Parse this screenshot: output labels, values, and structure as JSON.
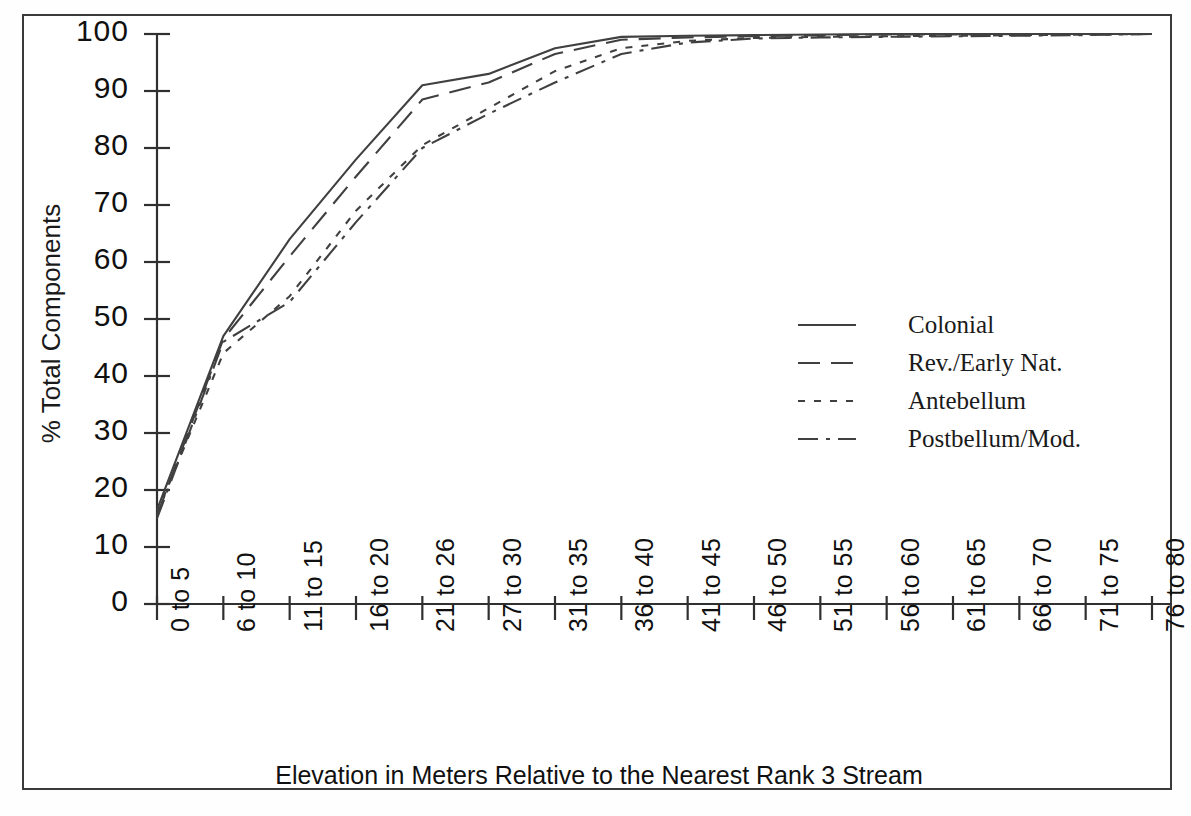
{
  "chart_data": {
    "type": "line",
    "title": "",
    "xlabel": "Elevation in Meters Relative to the Nearest Rank 3 Stream",
    "ylabel": "% Total Components",
    "categories": [
      "0 to 5",
      "6 to 10",
      "11 to 15",
      "16 to 20",
      "21 to 26",
      "27 to 30",
      "31 to 35",
      "36 to 40",
      "41 to 45",
      "46 to 50",
      "51 to 55",
      "56 to 60",
      "61 to 65",
      "66 to 70",
      "71 to 75",
      "76 to 80"
    ],
    "ylim": [
      0,
      100
    ],
    "yticks": [
      0,
      10,
      20,
      30,
      40,
      50,
      60,
      70,
      80,
      90,
      100
    ],
    "ytick_labels": [
      "0",
      "10",
      "20",
      "30",
      "40",
      "50",
      "60",
      "70",
      "80",
      "90",
      "100"
    ],
    "grid": false,
    "legend_position": "center-right",
    "series": [
      {
        "name": "Colonial",
        "dash": "solid",
        "values": [
          16.5,
          47.0,
          64.0,
          78.0,
          91.0,
          93.0,
          97.5,
          99.5,
          99.7,
          99.8,
          99.9,
          100.0,
          100.0,
          100.0,
          100.0,
          100.0
        ]
      },
      {
        "name": "Rev./Early Nat.",
        "dash": "dashed",
        "values": [
          15.5,
          46.5,
          61.0,
          75.0,
          88.5,
          91.5,
          96.5,
          99.0,
          99.4,
          99.6,
          99.8,
          99.9,
          99.9,
          100.0,
          100.0,
          100.0
        ]
      },
      {
        "name": "Antebellum",
        "dash": "dotted",
        "values": [
          16.0,
          44.0,
          54.0,
          69.0,
          80.5,
          87.0,
          93.5,
          97.5,
          98.8,
          99.3,
          99.5,
          99.6,
          99.7,
          99.8,
          99.9,
          100.0
        ]
      },
      {
        "name": "Postbellum/Mod.",
        "dash": "dashdot",
        "values": [
          15.0,
          46.0,
          53.0,
          67.0,
          80.0,
          86.0,
          91.5,
          96.5,
          98.5,
          99.2,
          99.4,
          99.5,
          99.6,
          99.7,
          99.8,
          100.0
        ]
      }
    ]
  },
  "legend": {
    "items": [
      {
        "label": "Colonial"
      },
      {
        "label": "Rev./Early Nat."
      },
      {
        "label": "Antebellum"
      },
      {
        "label": "Postbellum/Mod."
      }
    ]
  },
  "colors": {
    "line": "#404040",
    "axis": "#303030",
    "frame": "#3a3a3a",
    "text": "#101010",
    "background": "#ffffff"
  }
}
